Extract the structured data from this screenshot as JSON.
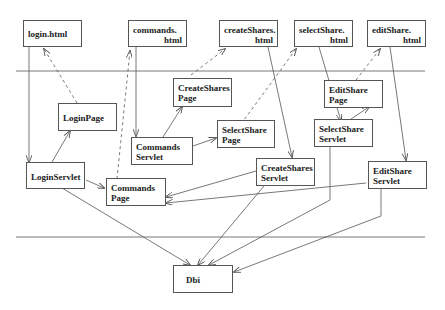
{
  "diagram": {
    "type": "architecture-flow",
    "layers": [
      "html pages",
      "page/servlet classes",
      "database interface"
    ],
    "nodes": [
      {
        "id": "login_html",
        "line1": "login.html",
        "line2": ""
      },
      {
        "id": "commands_html",
        "line1": "commands.",
        "line2": "html"
      },
      {
        "id": "createShares_html",
        "line1": "createShares.",
        "line2": "html"
      },
      {
        "id": "selectShare_html",
        "line1": "selectShare.",
        "line2": "html"
      },
      {
        "id": "editShare_html",
        "line1": "editShare.",
        "line2": "html"
      },
      {
        "id": "LoginPage",
        "line1": "LoginPage",
        "line2": ""
      },
      {
        "id": "CreateSharesPage",
        "line1": "CreateShares",
        "line2": "Page"
      },
      {
        "id": "SelectSharePage",
        "line1": "SelectShare",
        "line2": "Page"
      },
      {
        "id": "EditSharePage",
        "line1": "EditShare",
        "line2": "Page"
      },
      {
        "id": "CommandsServlet",
        "line1": "Commands",
        "line2": "Servlet"
      },
      {
        "id": "LoginServlet",
        "line1": "LoginServlet",
        "line2": ""
      },
      {
        "id": "CommandsPage",
        "line1": "Commands",
        "line2": "Page"
      },
      {
        "id": "CreateSharesServlet",
        "line1": "CreateShares",
        "line2": "Servlet"
      },
      {
        "id": "SelectShareServlet",
        "line1": "SelectShare",
        "line2": "Servlet"
      },
      {
        "id": "EditShareServlet",
        "line1": "EditShare",
        "line2": "Servlet"
      },
      {
        "id": "Dbi",
        "line1": "Dbi",
        "line2": ""
      }
    ],
    "edges": [
      {
        "from": "login_html",
        "to": "LoginServlet",
        "style": "solid"
      },
      {
        "from": "LoginServlet",
        "to": "LoginPage",
        "style": "solid"
      },
      {
        "from": "LoginPage",
        "to": "login_html",
        "style": "dashed"
      },
      {
        "from": "LoginServlet",
        "to": "CommandsPage",
        "style": "solid"
      },
      {
        "from": "CommandsPage",
        "to": "commands_html",
        "style": "dashed"
      },
      {
        "from": "commands_html",
        "to": "CommandsServlet",
        "style": "solid"
      },
      {
        "from": "CommandsServlet",
        "to": "CreateSharesPage",
        "style": "solid"
      },
      {
        "from": "CommandsServlet",
        "to": "SelectSharePage",
        "style": "solid"
      },
      {
        "from": "CreateSharesPage",
        "to": "createShares_html",
        "style": "dashed"
      },
      {
        "from": "SelectSharePage",
        "to": "selectShare_html",
        "style": "dashed"
      },
      {
        "from": "createShares_html",
        "to": "CreateSharesServlet",
        "style": "solid"
      },
      {
        "from": "selectShare_html",
        "to": "SelectShareServlet",
        "style": "solid"
      },
      {
        "from": "SelectShareServlet",
        "to": "EditSharePage",
        "style": "solid"
      },
      {
        "from": "EditSharePage",
        "to": "editShare_html",
        "style": "dashed"
      },
      {
        "from": "editShare_html",
        "to": "EditShareServlet",
        "style": "solid"
      },
      {
        "from": "CreateSharesServlet",
        "to": "CommandsPage",
        "style": "solid"
      },
      {
        "from": "EditShareServlet",
        "to": "CommandsPage",
        "style": "solid"
      },
      {
        "from": "LoginServlet",
        "to": "Dbi",
        "style": "solid"
      },
      {
        "from": "CreateSharesServlet",
        "to": "Dbi",
        "style": "solid"
      },
      {
        "from": "SelectShareServlet",
        "to": "Dbi",
        "style": "solid"
      },
      {
        "from": "EditShareServlet",
        "to": "Dbi",
        "style": "solid"
      }
    ]
  }
}
